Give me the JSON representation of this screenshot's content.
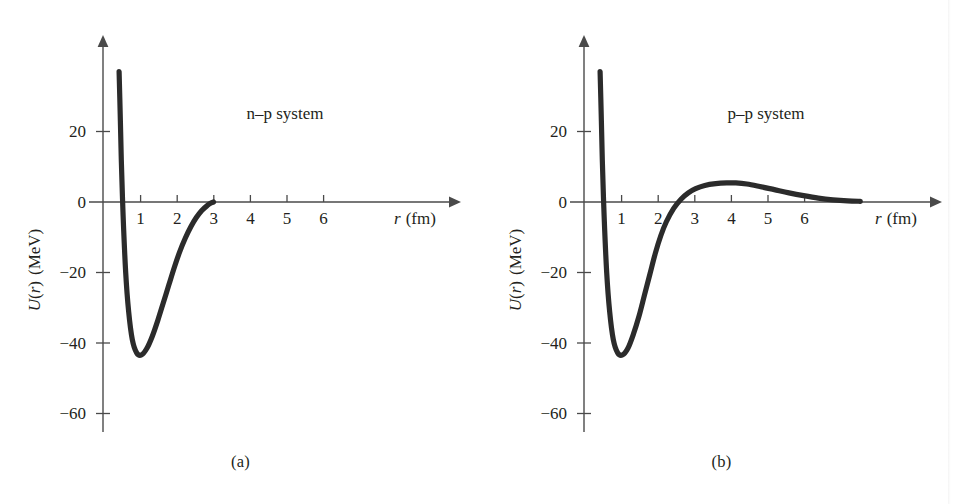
{
  "figure": {
    "background_color": "#ffffff",
    "ink_color": "#231f20",
    "curve_color": "#2b2b2b",
    "axis_color": "#4a4a4a"
  },
  "panels": [
    {
      "id": "a",
      "caption": "(a)",
      "system_label": "n–p system",
      "chart_data": {
        "type": "line",
        "title": "n–p system",
        "xlabel": "r (fm)",
        "ylabel": "U(r) (MeV)",
        "xlabel_symbol": "r",
        "xlabel_unit": "(fm)",
        "ylabel_symbol": "U",
        "ylabel_arg": "r",
        "ylabel_unit": "(MeV)",
        "xlim": [
          0,
          7.8
        ],
        "ylim": [
          -68,
          40
        ],
        "xticks": [
          1,
          2,
          3,
          4,
          5,
          6
        ],
        "xtick_labels": [
          "1",
          "2",
          "3",
          "4",
          "5",
          "6"
        ],
        "yticks": [
          20,
          0,
          -20,
          -40,
          -60
        ],
        "ytick_labels": [
          "20",
          "0",
          "−20",
          "−40",
          "−60"
        ],
        "grid": false,
        "legend": "none",
        "axis_style": "arrowed-axes",
        "series": [
          {
            "name": "n-p potential",
            "x": [
              0.44,
              0.47,
              0.5,
              0.55,
              0.62,
              0.7,
              0.8,
              0.92,
              1.05,
              1.2,
              1.35,
              1.5,
              1.65,
              1.8,
              1.95,
              2.1,
              2.25,
              2.4,
              2.55,
              2.7,
              2.85,
              2.95,
              3.02
            ],
            "y": [
              37.0,
              25.0,
              12.0,
              -4.0,
              -20.0,
              -31.0,
              -39.0,
              -42.8,
              -43.4,
              -41.5,
              -38.0,
              -33.5,
              -28.5,
              -23.5,
              -18.5,
              -14.0,
              -10.2,
              -7.0,
              -4.4,
              -2.4,
              -1.0,
              -0.3,
              0.0
            ]
          }
        ],
        "annotations": [
          {
            "text": "n–p system",
            "x": 3.55,
            "y": 26
          }
        ],
        "notes": "Short-range attractive nuclear potential; hard repulsive core near r≈0.45 fm, minimum ≈ −43 MeV near r≈1.05 fm, potential vanishes beyond r≈3 fm."
      }
    },
    {
      "id": "b",
      "caption": "(b)",
      "system_label": "p–p system",
      "chart_data": {
        "type": "line",
        "title": "p–p system",
        "xlabel": "r (fm)",
        "ylabel": "U(r) (MeV)",
        "xlabel_symbol": "r",
        "xlabel_unit": "(fm)",
        "ylabel_symbol": "U",
        "ylabel_arg": "r",
        "ylabel_unit": "(MeV)",
        "xlim": [
          0,
          7.8
        ],
        "ylim": [
          -68,
          40
        ],
        "xticks": [
          1,
          2,
          3,
          4,
          5,
          6
        ],
        "xtick_labels": [
          "1",
          "2",
          "3",
          "4",
          "5",
          "6"
        ],
        "yticks": [
          20,
          0,
          -20,
          -40,
          -60
        ],
        "ytick_labels": [
          "20",
          "0",
          "−20",
          "−40",
          "−60"
        ],
        "grid": false,
        "legend": "none",
        "axis_style": "arrowed-axes",
        "series": [
          {
            "name": "p-p potential",
            "x": [
              0.44,
              0.47,
              0.5,
              0.55,
              0.62,
              0.7,
              0.8,
              0.92,
              1.05,
              1.2,
              1.35,
              1.5,
              1.65,
              1.8,
              1.95,
              2.1,
              2.25,
              2.45,
              2.65,
              2.85,
              3.05,
              3.3,
              3.6,
              3.9,
              4.15,
              4.45,
              4.8,
              5.2,
              5.6,
              6.0,
              6.4,
              6.8,
              7.2,
              7.55
            ],
            "y": [
              37.0,
              25.0,
              12.0,
              -4.0,
              -20.0,
              -31.0,
              -39.0,
              -42.8,
              -43.4,
              -41.5,
              -37.5,
              -32.5,
              -26.5,
              -20.5,
              -14.5,
              -9.5,
              -5.6,
              -1.8,
              0.8,
              2.6,
              3.8,
              4.7,
              5.2,
              5.4,
              5.4,
              5.1,
              4.4,
              3.5,
              2.6,
              1.8,
              1.1,
              0.6,
              0.3,
              0.2
            ]
          }
        ],
        "annotations": [
          {
            "text": "p–p system",
            "x": 3.55,
            "y": 26
          }
        ],
        "notes": "Same nuclear well as n–p plus the repulsive Coulomb barrier: rises above zero past r≈2.6 fm, peaks at ≈ +5 MeV near r≈4.1 fm, decays slowly toward zero."
      }
    }
  ]
}
